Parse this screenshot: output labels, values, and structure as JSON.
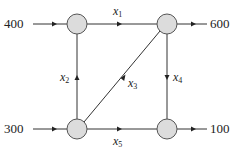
{
  "diagram": {
    "type": "network-flow",
    "nodes": [
      {
        "id": "A",
        "position": "top-left",
        "cx": 77,
        "cy": 24
      },
      {
        "id": "B",
        "position": "top-right",
        "cx": 167,
        "cy": 24
      },
      {
        "id": "C",
        "position": "bottom-left",
        "cx": 77,
        "cy": 129
      },
      {
        "id": "D",
        "position": "bottom-right",
        "cx": 167,
        "cy": 129
      }
    ],
    "external_flows": [
      {
        "label": "400",
        "node": "A",
        "direction": "in"
      },
      {
        "label": "600",
        "node": "B",
        "direction": "out"
      },
      {
        "label": "300",
        "node": "C",
        "direction": "in"
      },
      {
        "label": "100",
        "node": "D",
        "direction": "out"
      }
    ],
    "edges": [
      {
        "var": "x",
        "sub": "1",
        "from": "A",
        "to": "B"
      },
      {
        "var": "x",
        "sub": "2",
        "from": "C",
        "to": "A"
      },
      {
        "var": "x",
        "sub": "3",
        "from": "C",
        "to": "B"
      },
      {
        "var": "x",
        "sub": "4",
        "from": "B",
        "to": "D"
      },
      {
        "var": "x",
        "sub": "5",
        "from": "C",
        "to": "D"
      }
    ]
  },
  "labels": {
    "in_a": "400",
    "out_b": "600",
    "in_c": "300",
    "out_d": "100",
    "x": "x",
    "s1": "1",
    "s2": "2",
    "s3": "3",
    "s4": "4",
    "s5": "5"
  }
}
